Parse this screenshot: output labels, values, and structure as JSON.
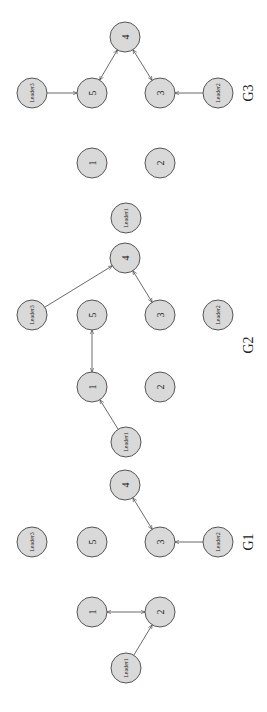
{
  "figure": {
    "orientation": "rotated-90-clockwise",
    "node_fill": "#d9d9d9",
    "node_stroke": "#555555",
    "graphs": [
      {
        "label": "G3",
        "label_pos": [
          248,
          93
        ],
        "nodes": [
          {
            "id": "4",
            "label": "4",
            "x": 125,
            "y": 37,
            "leader": false
          },
          {
            "id": "L3",
            "label": "Leader3",
            "x": 32,
            "y": 93,
            "leader": true
          },
          {
            "id": "5",
            "label": "5",
            "x": 92,
            "y": 93,
            "leader": false
          },
          {
            "id": "3",
            "label": "3",
            "x": 160,
            "y": 93,
            "leader": false
          },
          {
            "id": "L2",
            "label": "Leader2",
            "x": 218,
            "y": 93,
            "leader": true
          },
          {
            "id": "1",
            "label": "1",
            "x": 92,
            "y": 163,
            "leader": false
          },
          {
            "id": "2",
            "label": "2",
            "x": 160,
            "y": 163,
            "leader": false
          },
          {
            "id": "L1",
            "label": "Leader1",
            "x": 126,
            "y": 218,
            "leader": true
          }
        ],
        "edges": [
          {
            "from": "L3",
            "to": "5",
            "bidirectional": false
          },
          {
            "from": "L2",
            "to": "3",
            "bidirectional": false
          },
          {
            "from": "4",
            "to": "5",
            "bidirectional": true
          },
          {
            "from": "4",
            "to": "3",
            "bidirectional": true
          }
        ]
      },
      {
        "label": "G2",
        "label_pos": [
          248,
          345
        ],
        "nodes": [
          {
            "id": "4",
            "label": "4",
            "x": 125,
            "y": 258,
            "leader": false
          },
          {
            "id": "L3",
            "label": "Leader3",
            "x": 32,
            "y": 315,
            "leader": true
          },
          {
            "id": "5",
            "label": "5",
            "x": 92,
            "y": 315,
            "leader": false
          },
          {
            "id": "3",
            "label": "3",
            "x": 160,
            "y": 315,
            "leader": false
          },
          {
            "id": "L2",
            "label": "Leader2",
            "x": 218,
            "y": 315,
            "leader": true
          },
          {
            "id": "1",
            "label": "1",
            "x": 92,
            "y": 387,
            "leader": false
          },
          {
            "id": "2",
            "label": "2",
            "x": 160,
            "y": 387,
            "leader": false
          },
          {
            "id": "L1",
            "label": "Leader1",
            "x": 126,
            "y": 442,
            "leader": true
          }
        ],
        "edges": [
          {
            "from": "L3",
            "to": "4",
            "bidirectional": false
          },
          {
            "from": "4",
            "to": "3",
            "bidirectional": true
          },
          {
            "from": "5",
            "to": "1",
            "bidirectional": true
          },
          {
            "from": "L1",
            "to": "1",
            "bidirectional": false
          }
        ]
      },
      {
        "label": "G1",
        "label_pos": [
          248,
          542
        ],
        "nodes": [
          {
            "id": "4",
            "label": "4",
            "x": 125,
            "y": 485,
            "leader": false
          },
          {
            "id": "L3",
            "label": "Leader3",
            "x": 32,
            "y": 542,
            "leader": true
          },
          {
            "id": "5",
            "label": "5",
            "x": 92,
            "y": 542,
            "leader": false
          },
          {
            "id": "3",
            "label": "3",
            "x": 160,
            "y": 542,
            "leader": false
          },
          {
            "id": "L2",
            "label": "Leader2",
            "x": 218,
            "y": 542,
            "leader": true
          },
          {
            "id": "1",
            "label": "1",
            "x": 92,
            "y": 612,
            "leader": false
          },
          {
            "id": "2",
            "label": "2",
            "x": 160,
            "y": 612,
            "leader": false
          },
          {
            "id": "L1",
            "label": "Leader1",
            "x": 126,
            "y": 668,
            "leader": true
          }
        ],
        "edges": [
          {
            "from": "4",
            "to": "3",
            "bidirectional": true
          },
          {
            "from": "L2",
            "to": "3",
            "bidirectional": false
          },
          {
            "from": "1",
            "to": "2",
            "bidirectional": true
          },
          {
            "from": "L1",
            "to": "2",
            "bidirectional": false
          }
        ]
      }
    ]
  }
}
